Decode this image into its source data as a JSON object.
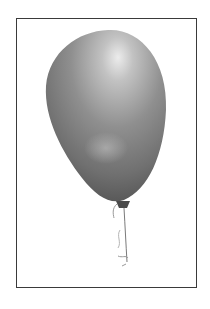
{
  "image": {
    "subject": "balloon",
    "description": "Grayscale illustration of a single balloon on a string inside a thin rectangular frame",
    "colors": {
      "frame": "#3a3a3a",
      "balloon_dark": "#5e5e5e",
      "balloon_mid": "#8a8a8a",
      "balloon_highlight": "#e6e6e6",
      "string": "#7a7a7a",
      "background": "#ffffff"
    }
  }
}
